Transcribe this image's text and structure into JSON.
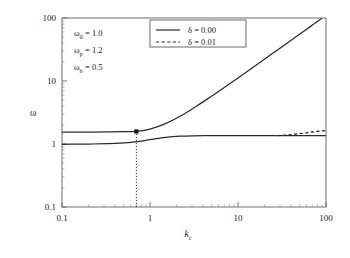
{
  "chart_data": {
    "type": "line",
    "title": "",
    "xlabel": "k_c",
    "ylabel": "ω",
    "xscale": "log",
    "yscale": "log",
    "xlim": [
      0.1,
      100
    ],
    "ylim": [
      0.1,
      100
    ],
    "grid": false,
    "xticks": [
      "0.1",
      "1",
      "10",
      "100"
    ],
    "xtick_values": [
      0.1,
      1,
      10,
      100
    ],
    "yticks": [
      "0.1",
      "1",
      "10",
      "100"
    ],
    "ytick_values": [
      0.1,
      1,
      10,
      100
    ],
    "legend_position": "top-center",
    "series": [
      {
        "name": "δ = 0.00",
        "style": "solid",
        "color": "#2b2b2b",
        "branch": "upper",
        "x": [
          0.1,
          0.15,
          0.22,
          0.32,
          0.46,
          0.68,
          1.0,
          1.5,
          2.2,
          3.2,
          4.6,
          6.8,
          10,
          15,
          22,
          32,
          46,
          68,
          90
        ],
        "y": [
          1.55,
          1.55,
          1.55,
          1.56,
          1.57,
          1.58,
          1.72,
          2.1,
          2.75,
          3.8,
          5.3,
          7.7,
          11.2,
          16.7,
          24.4,
          35.4,
          50.8,
          75.0,
          99.0
        ]
      },
      {
        "name": "δ = 0.00",
        "style": "solid",
        "color": "#2b2b2b",
        "branch": "lower",
        "x": [
          0.1,
          0.15,
          0.22,
          0.32,
          0.46,
          0.68,
          1.0,
          1.5,
          2.2,
          3.2,
          4.6,
          6.8,
          10,
          15,
          22,
          32,
          46,
          68,
          100
        ],
        "y": [
          0.99,
          0.995,
          1.0,
          1.01,
          1.03,
          1.08,
          1.17,
          1.27,
          1.33,
          1.35,
          1.355,
          1.36,
          1.36,
          1.36,
          1.36,
          1.36,
          1.36,
          1.36,
          1.36
        ]
      },
      {
        "name": "δ = 0.01",
        "style": "dashed",
        "color": "#2b2b2b",
        "branch": "lower-perturbed",
        "x": [
          28,
          34,
          40,
          48,
          58,
          70,
          85,
          100
        ],
        "y": [
          1.36,
          1.38,
          1.41,
          1.45,
          1.5,
          1.55,
          1.6,
          1.63
        ]
      }
    ],
    "markers": [
      {
        "name": "critical-point",
        "shape": "square",
        "x": 0.7,
        "y": 1.58,
        "color": "#111111"
      }
    ],
    "guides": [
      {
        "name": "critical-kc-dropline",
        "style": "dotted",
        "orientation": "vertical",
        "x": 0.7,
        "y_from": 0.1,
        "y_to": 1.58
      }
    ]
  },
  "annotations": {
    "params": [
      {
        "symbol": "ω",
        "subscript": "0",
        "equals": "=",
        "value": "1.0"
      },
      {
        "symbol": "ω",
        "subscript": "p",
        "equals": "=",
        "value": "1.2"
      },
      {
        "symbol": "ω",
        "subscript": "b",
        "equals": "=",
        "value": "0.5"
      }
    ]
  },
  "legend": {
    "entries": [
      {
        "label": "δ = 0.00",
        "style": "solid"
      },
      {
        "label": "δ = 0.01",
        "style": "dashed"
      }
    ]
  },
  "axes": {
    "x_title_main": "k",
    "x_title_sub": "c",
    "y_title": "ω"
  },
  "colors": {
    "line": "#2b2b2b",
    "frame": "#6f6f6f",
    "text": "#1a1a1a",
    "background": "#ffffff"
  }
}
